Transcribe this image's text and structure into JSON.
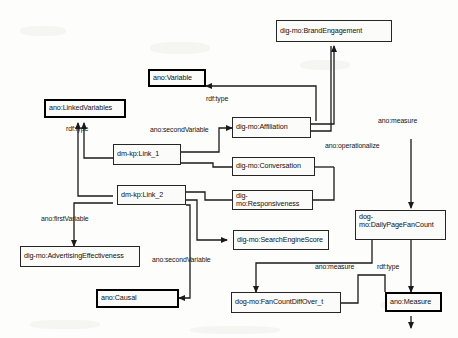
{
  "diagram": {
    "stroke_color": "#262626",
    "background_color": "#fdfdfc",
    "nodes": [
      {
        "id": "brand_engagement",
        "label": "dig-mo:BrandEngagement",
        "style": "plain"
      },
      {
        "id": "ano_variable",
        "label": "ano:Variable",
        "style": "bold"
      },
      {
        "id": "ano_linked",
        "label": "ano:LinkedVariables",
        "style": "bold"
      },
      {
        "id": "link1",
        "label": "dm-kp:Link_1",
        "style": "plain"
      },
      {
        "id": "link2",
        "label": "dm-kp:Link_2",
        "style": "plain"
      },
      {
        "id": "affiliation",
        "label": "dig-mo:Affiliation",
        "style": "plain"
      },
      {
        "id": "conversation",
        "label": "dig-mo:Conversation",
        "style": "plain"
      },
      {
        "id": "responsiveness",
        "label": "dig-mo:Responsiveness",
        "style": "plain"
      },
      {
        "id": "search_engine",
        "label": "dig-mo:SearchEngineScore",
        "style": "plain"
      },
      {
        "id": "advertising",
        "label": "dig-mo:AdvertisingEffectiveness",
        "style": "plain"
      },
      {
        "id": "ano_causal",
        "label": "ano:Causal",
        "style": "bold"
      },
      {
        "id": "daily_fan_count",
        "label": "dog-\nmo:DailyPageFanCount",
        "style": "plain"
      },
      {
        "id": "fan_count_diff",
        "label": "dog-mo:FanCountDiffOver_t",
        "style": "plain"
      },
      {
        "id": "ano_measure_class",
        "label": "ano:Measure",
        "style": "bold"
      }
    ],
    "edge_labels": [
      {
        "id": "rdftype_variable",
        "label": "rdf:type"
      },
      {
        "id": "rdftype_linked",
        "label": "rdf:type"
      },
      {
        "id": "second_variable_top",
        "label": "ano:secondVariable"
      },
      {
        "id": "first_variable",
        "label": "ano:firstVariable"
      },
      {
        "id": "second_variable_bottom",
        "label": "ano:secondVariable"
      },
      {
        "id": "measure_top",
        "label": "ano:measure"
      },
      {
        "id": "operationalize",
        "label": "ano:operationalize"
      },
      {
        "id": "measure_bottom",
        "label": "ano:measure"
      },
      {
        "id": "rdftype_measure",
        "label": "rdf:type"
      }
    ]
  }
}
